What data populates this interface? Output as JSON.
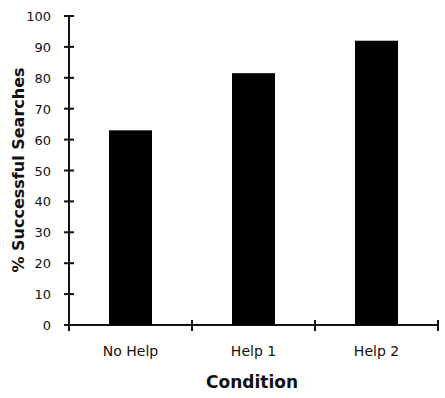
{
  "chart_data": {
    "type": "bar",
    "title": "",
    "xlabel": "Condition",
    "ylabel": "% Successful Searches",
    "categories": [
      "No Help",
      "Help 1",
      "Help 2"
    ],
    "values": [
      63,
      81.5,
      92
    ],
    "ylim": [
      0,
      100
    ],
    "yticks": [
      0,
      10,
      20,
      30,
      40,
      50,
      60,
      70,
      80,
      90,
      100
    ],
    "grid": false,
    "legend": null,
    "bar_color": "#000000"
  }
}
